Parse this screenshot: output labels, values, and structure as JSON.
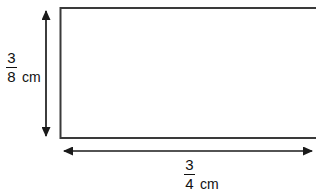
{
  "figure": {
    "type": "rectangle-dimension-diagram",
    "shape": {
      "name": "rectangle",
      "fill": "#ffffff",
      "stroke": "#3a3a3a",
      "stroke_width": 2
    },
    "background": "#ffffff",
    "ink_color": "#111111",
    "arrow_color": "#1a1a1a",
    "height_dimension": {
      "label_numerator": "3",
      "label_denominator": "8",
      "unit": "cm",
      "value": 0.375,
      "orientation": "vertical",
      "arrow_style": "double-headed"
    },
    "width_dimension": {
      "label_numerator": "3",
      "label_denominator": "4",
      "unit": "cm",
      "value": 0.75,
      "orientation": "horizontal",
      "arrow_style": "double-headed"
    }
  }
}
